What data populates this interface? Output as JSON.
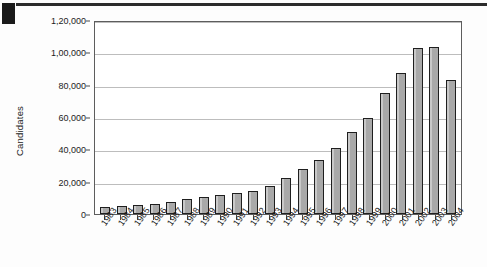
{
  "chart_data": {
    "type": "bar",
    "title": "",
    "xlabel": "",
    "ylabel": "Candidates",
    "ylim": [
      0,
      120000
    ],
    "ytick_labels": [
      "1,20,000",
      "1,00,000",
      "80,000",
      "60,000",
      "40,000",
      "20,000",
      "0"
    ],
    "ytick_values": [
      120000,
      100000,
      80000,
      60000,
      40000,
      20000,
      0
    ],
    "grid": true,
    "legend": null,
    "categories": [
      "1983",
      "1984",
      "1985",
      "1986",
      "1987",
      "1988",
      "1989",
      "1990",
      "1991",
      "1992",
      "1993",
      "1994",
      "1995",
      "1996",
      "1997",
      "1998",
      "1999",
      "2000",
      "2001",
      "2002",
      "2003",
      "2004"
    ],
    "values": [
      4500,
      5200,
      5800,
      6500,
      7500,
      9500,
      10500,
      11500,
      13000,
      14500,
      17500,
      22000,
      28000,
      33500,
      41000,
      50500,
      59500,
      75000,
      87000,
      102500,
      103500,
      83000
    ],
    "bar_color": "#a9a9a9",
    "bar_border_color": "#1f1f1f",
    "gridline_color": "#bdbdbd",
    "axis_color": "#5d5d5d"
  },
  "page": {
    "rule_color": "#2b2b2b",
    "corner_mark_color": "#1a1a1a"
  }
}
